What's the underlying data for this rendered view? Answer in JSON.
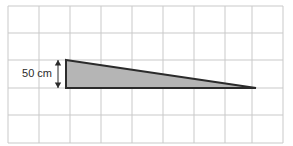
{
  "figure": {
    "background_color": "#ffffff",
    "width": 293,
    "height": 146
  },
  "grid": {
    "line_color": "#c9c9c9",
    "line_width": 1,
    "x_lines": [
      8,
      39,
      70,
      101,
      132,
      163,
      194,
      225,
      252,
      283
    ],
    "y_lines": [
      6,
      33,
      60,
      88,
      115,
      143
    ],
    "left": 8,
    "right": 283,
    "top": 6,
    "bottom": 143
  },
  "shape": {
    "name": "triangle",
    "kind": "right-triangle",
    "fill_color": "#b5b5b5",
    "stroke_color": "#2b2b2b",
    "stroke_width": 2,
    "vertices": [
      {
        "x": 66,
        "y": 60
      },
      {
        "x": 256,
        "y": 88
      },
      {
        "x": 66,
        "y": 88
      }
    ],
    "points": "66,60 256,88 66,88"
  },
  "dimension": {
    "name": "height-dimension",
    "label": "50 cm",
    "value": "50",
    "unit": "cm",
    "color": "#2b2b2b",
    "line_x": 58,
    "top_y": 60,
    "bottom_y": 88,
    "label_x": 52,
    "label_y": 74,
    "arrowhead": "double"
  }
}
